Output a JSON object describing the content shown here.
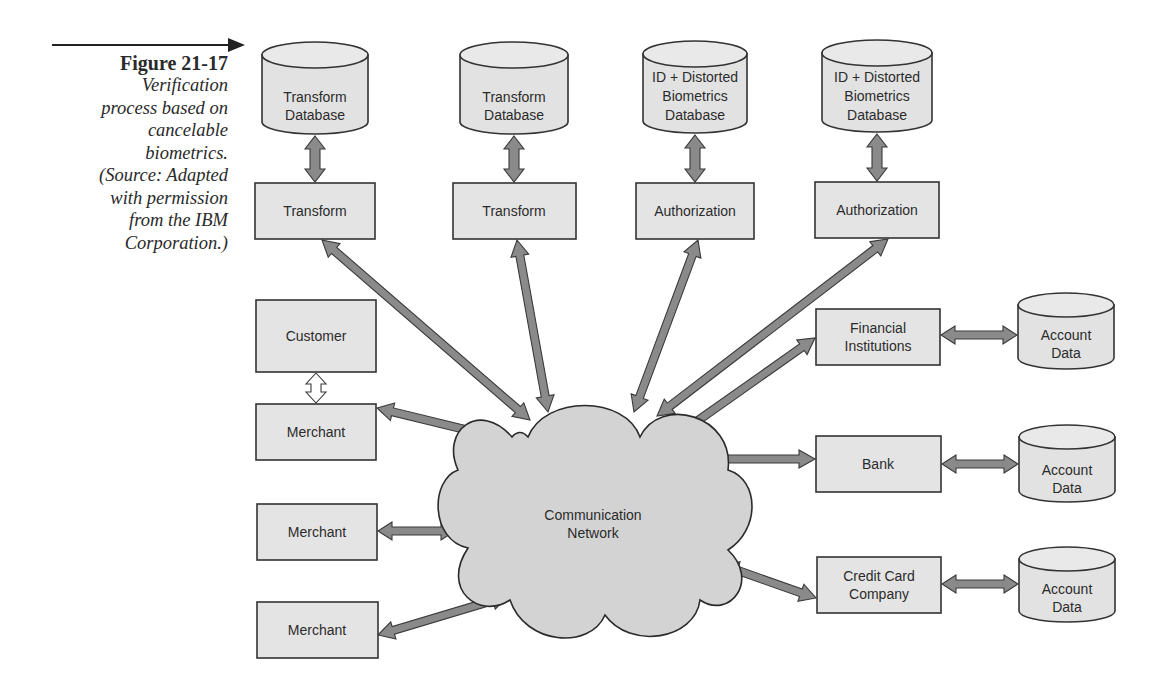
{
  "caption": {
    "figure_number": "Figure 21-17",
    "description_lines": [
      "Verification",
      "process based on",
      "cancelable",
      "biometrics.",
      "(Source: Adapted",
      "with permission",
      "from the IBM",
      "Corporation.)"
    ]
  },
  "colors": {
    "box_fill": "#e4e4e4",
    "cloud_fill": "#d3d3d3",
    "arrow_fill": "#8a8a8a",
    "stroke": "#333333"
  },
  "diagram": {
    "cloud": {
      "id": "network",
      "lines": [
        "Communication",
        "Network"
      ]
    },
    "databases": [
      {
        "id": "db-transform-1",
        "lines": [
          "Transform",
          "Database"
        ]
      },
      {
        "id": "db-transform-2",
        "lines": [
          "Transform",
          "Database"
        ]
      },
      {
        "id": "db-biometrics-1",
        "lines": [
          "ID + Distorted",
          "Biometrics",
          "Database"
        ]
      },
      {
        "id": "db-biometrics-2",
        "lines": [
          "ID + Distorted",
          "Biometrics",
          "Database"
        ]
      },
      {
        "id": "db-account-1",
        "lines": [
          "Account",
          "Data"
        ]
      },
      {
        "id": "db-account-2",
        "lines": [
          "Account",
          "Data"
        ]
      },
      {
        "id": "db-account-3",
        "lines": [
          "Account",
          "Data"
        ]
      }
    ],
    "boxes": [
      {
        "id": "transform-1",
        "lines": [
          "Transform"
        ]
      },
      {
        "id": "transform-2",
        "lines": [
          "Transform"
        ]
      },
      {
        "id": "authorization-1",
        "lines": [
          "Authorization"
        ]
      },
      {
        "id": "authorization-2",
        "lines": [
          "Authorization"
        ]
      },
      {
        "id": "customer",
        "lines": [
          "Customer"
        ]
      },
      {
        "id": "merchant-1",
        "lines": [
          "Merchant"
        ]
      },
      {
        "id": "merchant-2",
        "lines": [
          "Merchant"
        ]
      },
      {
        "id": "merchant-3",
        "lines": [
          "Merchant"
        ]
      },
      {
        "id": "financial-institutions",
        "lines": [
          "Financial",
          "Institutions"
        ]
      },
      {
        "id": "bank",
        "lines": [
          "Bank"
        ]
      },
      {
        "id": "credit-card-company",
        "lines": [
          "Credit Card",
          "Company"
        ]
      }
    ],
    "connections": [
      {
        "from": "db-transform-1",
        "to": "transform-1",
        "style": "double"
      },
      {
        "from": "db-transform-2",
        "to": "transform-2",
        "style": "double"
      },
      {
        "from": "db-biometrics-1",
        "to": "authorization-1",
        "style": "double"
      },
      {
        "from": "db-biometrics-2",
        "to": "authorization-2",
        "style": "double"
      },
      {
        "from": "transform-1",
        "to": "network",
        "style": "double"
      },
      {
        "from": "transform-2",
        "to": "network",
        "style": "double"
      },
      {
        "from": "authorization-1",
        "to": "network",
        "style": "double"
      },
      {
        "from": "authorization-2",
        "to": "network",
        "style": "double"
      },
      {
        "from": "customer",
        "to": "merchant-1",
        "style": "hollow-double"
      },
      {
        "from": "merchant-1",
        "to": "network",
        "style": "double"
      },
      {
        "from": "merchant-2",
        "to": "network",
        "style": "double"
      },
      {
        "from": "merchant-3",
        "to": "network",
        "style": "double"
      },
      {
        "from": "financial-institutions",
        "to": "network",
        "style": "double"
      },
      {
        "from": "bank",
        "to": "network",
        "style": "double"
      },
      {
        "from": "credit-card-company",
        "to": "network",
        "style": "double"
      },
      {
        "from": "financial-institutions",
        "to": "db-account-1",
        "style": "double"
      },
      {
        "from": "bank",
        "to": "db-account-2",
        "style": "double"
      },
      {
        "from": "credit-card-company",
        "to": "db-account-3",
        "style": "double"
      }
    ]
  }
}
